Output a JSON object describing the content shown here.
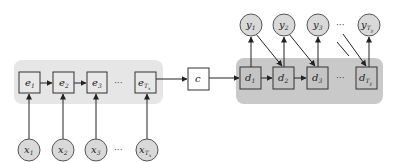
{
  "colors": {
    "background": "#ffffff",
    "encoder_band": "#e6e6e6",
    "decoder_band": "#c9c9c9",
    "node_fill_encoder": "#e8e8e8",
    "node_fill_decoder": "#c4c4c4",
    "circle_fill": "#d9d9d9",
    "stroke": "#333333"
  },
  "encoder": {
    "states": [
      {
        "base": "e",
        "sub": "1"
      },
      {
        "base": "e",
        "sub": "2"
      },
      {
        "base": "e",
        "sub": "3"
      },
      {
        "base": "e",
        "sub": "T",
        "subsub": "x"
      }
    ],
    "inputs": [
      {
        "base": "x",
        "sub": "1"
      },
      {
        "base": "x",
        "sub": "2"
      },
      {
        "base": "x",
        "sub": "3"
      },
      {
        "base": "x",
        "sub": "T",
        "subsub": "x"
      }
    ],
    "ellipsis": "···"
  },
  "context": {
    "label": "c"
  },
  "decoder": {
    "states": [
      {
        "base": "d",
        "sub": "1"
      },
      {
        "base": "d",
        "sub": "2"
      },
      {
        "base": "d",
        "sub": "3"
      },
      {
        "base": "d",
        "sub": "T",
        "subsub": "y"
      }
    ],
    "outputs": [
      {
        "base": "y",
        "sub": "1"
      },
      {
        "base": "y",
        "sub": "2"
      },
      {
        "base": "y",
        "sub": "3"
      },
      {
        "base": "y",
        "sub": "T",
        "subsub": "y"
      }
    ],
    "ellipsis": "···"
  }
}
